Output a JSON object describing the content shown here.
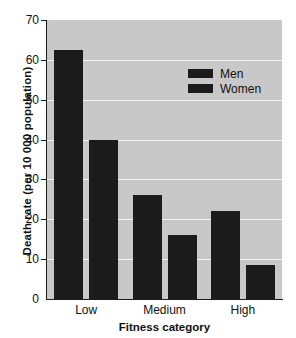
{
  "chart_data": {
    "type": "bar",
    "title": "",
    "xlabel": "Fitness category",
    "ylabel": "Death rate (per 10 000 population)",
    "categories": [
      "Low",
      "Medium",
      "High"
    ],
    "series": [
      {
        "name": "Men",
        "values": [
          62.5,
          26.0,
          22.0
        ]
      },
      {
        "name": "Women",
        "values": [
          40.0,
          16.0,
          8.5
        ]
      }
    ],
    "ylim": [
      0,
      70
    ],
    "yticks": [
      0,
      10,
      20,
      30,
      40,
      50,
      60,
      70
    ],
    "ytick_labels": [
      "0",
      "10",
      "20",
      "30",
      "40",
      "50",
      "60",
      "70"
    ],
    "grid": true,
    "grid_axis": "y",
    "legend_position": "upper right",
    "colors": {
      "men": "#1b1b1b",
      "women": "#1b1b1b",
      "plot_background": "#c8c8c8",
      "gridline": "#f2f2f2",
      "axis": "#1d1d1d",
      "text": "#111111",
      "figure_background": "#ffffff"
    }
  },
  "legend": {
    "items": [
      {
        "label": "Men"
      },
      {
        "label": "Women"
      }
    ]
  },
  "title_sliver": {
    "text": ""
  }
}
